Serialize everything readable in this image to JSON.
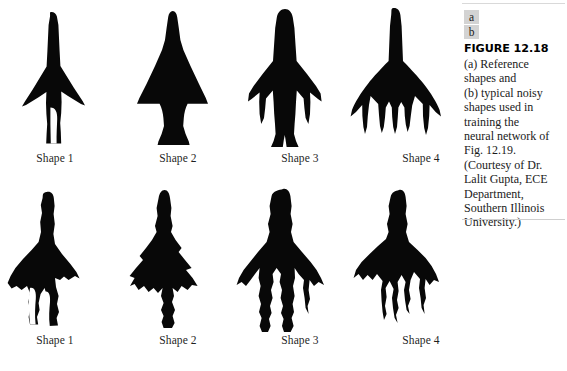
{
  "figure": {
    "panel_keys": [
      "a",
      "b"
    ],
    "title": "FIGURE 12.18",
    "caption_lines": [
      "(a) Reference",
      "shapes and",
      "(b) typical noisy",
      "shapes used in",
      "training the",
      "neural network of",
      "Fig. 12.19.",
      "(Courtesy of Dr.",
      "Lalit Gupta, ECE",
      "Department,",
      "Southern Illinois",
      "University.)"
    ],
    "caption_text": "(a) Reference shapes and (b) typical noisy shapes used in training the neural network of Fig. 12.19. (Courtesy of Dr. Lalit Gupta, ECE Department, Southern Illinois University.)",
    "ink_color": "#000000",
    "background_color": "#ffffff",
    "key_box_color": "#d3d3d3",
    "rule_color": "#d9d9d9"
  },
  "rows": [
    {
      "key": "a",
      "description": "Reference shapes",
      "cells": [
        {
          "label": "Shape 1",
          "shape_name": "reference-shape-1-rocket"
        },
        {
          "label": "Shape 2",
          "shape_name": "reference-shape-2-delta"
        },
        {
          "label": "Shape 3",
          "shape_name": "reference-shape-3-aircraft"
        },
        {
          "label": "Shape 4",
          "shape_name": "reference-shape-4-trident"
        }
      ]
    },
    {
      "key": "b",
      "description": "Typical noisy shapes",
      "cells": [
        {
          "label": "Shape 1",
          "shape_name": "noisy-shape-1-rocket"
        },
        {
          "label": "Shape 2",
          "shape_name": "noisy-shape-2-delta"
        },
        {
          "label": "Shape 3",
          "shape_name": "noisy-shape-3-aircraft"
        },
        {
          "label": "Shape 4",
          "shape_name": "noisy-shape-4-trident"
        }
      ]
    }
  ]
}
